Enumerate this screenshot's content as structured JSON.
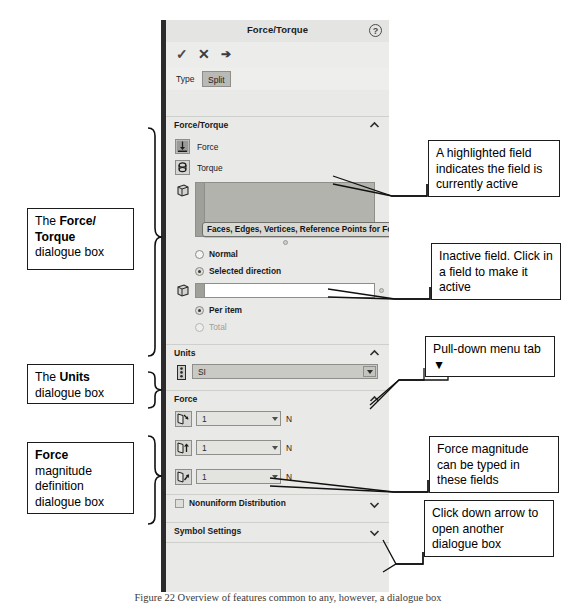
{
  "panel": {
    "title": "Force/Torque",
    "help_icon": "?",
    "actions": [
      {
        "name": "accept",
        "glyph": "✓"
      },
      {
        "name": "cancel",
        "glyph": "✕"
      },
      {
        "name": "pin",
        "glyph": "➔"
      }
    ],
    "tabs": [
      {
        "label": "Type",
        "selected": false
      },
      {
        "label": "Split",
        "selected": true
      }
    ],
    "sections": {
      "force_torque": {
        "header": "Force/Torque",
        "collapse_state": "expanded",
        "type_options": [
          {
            "label": "Force",
            "icon": "force-icon"
          },
          {
            "label": "Torque",
            "icon": "torque-icon"
          }
        ],
        "selection_field_active": {
          "icon": "faces-edges-icon",
          "value": "",
          "tooltip": "Faces, Edges, Vertices, Reference Points for Force",
          "state": "highlighted"
        },
        "direction_options": [
          {
            "label": "Normal",
            "selected": false,
            "enabled": true
          },
          {
            "label": "Selected direction",
            "selected": true,
            "enabled": true
          }
        ],
        "selection_field_inactive": {
          "icon": "faces-edges-icon",
          "value": "",
          "state": "inactive"
        },
        "distribution_options": [
          {
            "label": "Per item",
            "selected": true,
            "enabled": true
          },
          {
            "label": "Total",
            "selected": false,
            "enabled": false
          }
        ]
      },
      "units": {
        "header": "Units",
        "collapse_state": "expanded",
        "icon": "units-icon",
        "selected": "SI",
        "dropdown_glyph": "▼"
      },
      "force": {
        "header": "Force",
        "collapse_state": "expanded",
        "fields": [
          {
            "icon": "force-x-icon",
            "value": "1",
            "unit": "N"
          },
          {
            "icon": "force-y-icon",
            "value": "1",
            "unit": "N"
          },
          {
            "icon": "force-z-icon",
            "value": "1",
            "unit": "N"
          }
        ]
      },
      "nonuniform": {
        "label": "Nonuniform Distribution",
        "checked": false,
        "collapse_state": "collapsed"
      },
      "symbol_settings": {
        "header": "Symbol Settings",
        "collapse_state": "collapsed"
      }
    }
  },
  "callouts": {
    "left": [
      {
        "name": "force-torque-dialogue-label",
        "lines": [
          {
            "text": "The ",
            "bold": false
          },
          {
            "text": "Force/",
            "bold": true
          },
          {
            "text": "Torque",
            "bold": true
          },
          {
            "text": "dialogue box",
            "bold": false
          }
        ],
        "text": "The Force/ Torque dialogue box"
      },
      {
        "name": "units-dialogue-label",
        "text": "The Units dialogue box"
      },
      {
        "name": "force-magnitude-dialogue-label",
        "text": "Force magnitude definition dialogue box"
      }
    ],
    "right": [
      {
        "name": "highlighted-field-note",
        "text": "A highlighted field indicates the field is currently active"
      },
      {
        "name": "inactive-field-note",
        "text": "Inactive field. Click in a field to make it active"
      },
      {
        "name": "pulldown-menu-note",
        "text": "Pull-down menu tab ▼"
      },
      {
        "name": "force-magnitude-note",
        "text": "Force magnitude can be typed in these fields"
      },
      {
        "name": "down-arrow-note",
        "text": "Click down arrow to open another dialogue box"
      }
    ]
  },
  "figure_caption": "Figure 22  Overview of features common to any, however, a dialogue box"
}
